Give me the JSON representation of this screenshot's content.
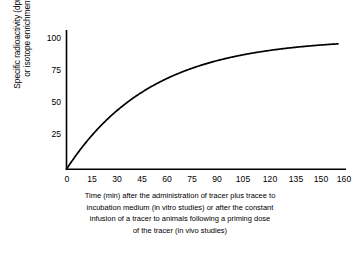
{
  "chart_data": {
    "type": "line",
    "title": "",
    "xlabel": "Time (min) after the administration of tracer plus tracee to incubation medium (in vitro studies) or after the constant infusion of a tracer to animals following a priming dose of the tracer (in vivo studies)",
    "ylabel": "Specific radioactivity (dpm/nmol) or isotope enrichment (%)",
    "ylabel_lines": [
      "Specific radioactivity (dpm/nmol)",
      "or isotope enrichment (%)"
    ],
    "xlabel_lines": [
      "Time (min) after the administration of tracer plus tracee to",
      "incubation medium (in vitro studies) or after the constant",
      "infusion of a tracer to animals following a priming dose",
      "of the tracer (in vivo studies)"
    ],
    "xlim": [
      0,
      160
    ],
    "ylim": [
      0,
      115
    ],
    "xticks": [
      0,
      15,
      30,
      45,
      60,
      75,
      90,
      105,
      120,
      135,
      150,
      160
    ],
    "xtick_labels": [
      "0",
      "15",
      "30",
      "45",
      "60",
      "75",
      "90",
      "105",
      "120",
      "135",
      "150",
      "160"
    ],
    "yticks": [
      25,
      50,
      75,
      100
    ],
    "ytick_labels": [
      "25",
      "50",
      "75",
      "100"
    ],
    "grid": false,
    "legend": "none",
    "series": [
      {
        "name": "Specific radioactivity rise to plateau",
        "model": "y = 100 * (1 - exp(-t / 50))",
        "x": [
          0,
          2,
          4,
          6,
          8,
          10,
          15,
          20,
          25,
          30,
          35,
          40,
          45,
          50,
          60,
          70,
          75,
          80,
          90,
          100,
          105,
          110,
          120,
          130,
          135,
          140,
          150,
          160
        ],
        "values": [
          0,
          3.9,
          7.7,
          11.3,
          14.8,
          18.1,
          25.9,
          33.0,
          39.3,
          45.1,
          50.3,
          55.1,
          59.3,
          63.2,
          69.9,
          75.3,
          77.7,
          79.8,
          83.5,
          86.5,
          87.8,
          89.0,
          90.9,
          92.6,
          93.3,
          93.9,
          95.0,
          96.0
        ]
      }
    ],
    "colors": {
      "curve": "#000000",
      "axis": "#000000",
      "background": "#ffffff",
      "text": "#000000"
    }
  }
}
